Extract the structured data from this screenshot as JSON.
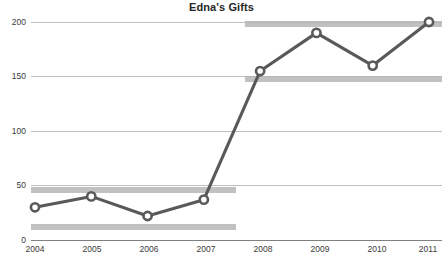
{
  "chart_data": {
    "type": "line",
    "title": "Edna's Gifts",
    "xlabel": "",
    "ylabel": "",
    "categories": [
      "2004",
      "2005",
      "2006",
      "2007",
      "2008",
      "2009",
      "2010",
      "2011"
    ],
    "x": [
      2004,
      2005,
      2006,
      2007,
      2008,
      2009,
      2010,
      2011
    ],
    "values": [
      30,
      40,
      22,
      37,
      155,
      190,
      160,
      200
    ],
    "series": [
      {
        "name": "Gifts",
        "values": [
          30,
          40,
          22,
          37,
          155,
          190,
          160,
          200
        ]
      }
    ],
    "ylim": [
      0,
      200
    ],
    "yticks": [
      0,
      50,
      100,
      150,
      200
    ],
    "ytick_labels": [
      "0",
      "50",
      "100",
      "150",
      "200"
    ],
    "xtick_labels": [
      "2004",
      "2005",
      "2006",
      "2007",
      "2008",
      "2009",
      "2010",
      "2011"
    ],
    "grid": true,
    "legend": false,
    "legend_position": "none",
    "marker": "circle",
    "line_color": "#595959",
    "marker_fill": "#ffffff",
    "grid_color": "#bfbfbf",
    "axis_color": "#808080",
    "highlight_color": "#b3b3b3",
    "highlight_bands": [
      {
        "label": "band-200-right",
        "value": 200,
        "x_start": 2007.8,
        "x_end": 2011.1
      },
      {
        "label": "band-150-right",
        "value": 152,
        "x_start": 2007.8,
        "x_end": 2011.1
      },
      {
        "label": "band-47-left",
        "value": 46,
        "x_start": 2003.9,
        "x_end": 2007.6
      },
      {
        "label": "band-20-left",
        "value": 20,
        "x_start": 2003.9,
        "x_end": 2007.6
      }
    ]
  },
  "axis": {
    "y_labels": [
      "200",
      "150",
      "100",
      "50",
      "0"
    ],
    "x_labels": [
      "2004",
      "2005",
      "2006",
      "2007",
      "2008",
      "2009",
      "2010",
      "2011"
    ]
  },
  "title": {
    "text": "Edna's Gifts"
  }
}
